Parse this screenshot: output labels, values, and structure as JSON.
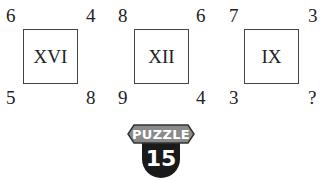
{
  "puzzle": {
    "squares": [
      {
        "roman": "XVI",
        "top_left": "6",
        "top_right": "4",
        "bottom_left": "5",
        "bottom_right": "8"
      },
      {
        "roman": "XII",
        "top_left": "8",
        "top_right": "6",
        "bottom_left": "9",
        "bottom_right": "4"
      },
      {
        "roman": "IX",
        "top_left": "7",
        "top_right": "3",
        "bottom_left": "3",
        "bottom_right": "?"
      }
    ]
  },
  "badge": {
    "label": "PUZZLE",
    "number": "15",
    "colors": {
      "label_bg": "#8a8a8a",
      "label_border": "#333333",
      "number_bg": "#1a1a1a"
    }
  }
}
